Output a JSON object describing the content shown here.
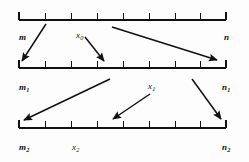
{
  "figure": {
    "background": "#fdfdfd",
    "ink": "#111111",
    "width": 249,
    "height": 162,
    "rows": [
      {
        "id": "row-0",
        "y": 20,
        "x_start": 19,
        "x_end": 226,
        "ticks": [
          19,
          45,
          71,
          97,
          123,
          149,
          175,
          200,
          226
        ],
        "end_caps": [
          "left",
          "right"
        ],
        "labels": [
          {
            "name": "m",
            "text": "m",
            "sub": "",
            "x": 19,
            "y": 33,
            "style": "bold-italic"
          },
          {
            "name": "x0",
            "text": "x",
            "sub": "0",
            "x": 76,
            "y": 31,
            "style": "plain-italic"
          },
          {
            "name": "n",
            "text": "n",
            "sub": "",
            "x": 224,
            "y": 33,
            "style": "bold-italic"
          }
        ]
      },
      {
        "id": "row-1",
        "y": 68,
        "x_start": 19,
        "x_end": 226,
        "ticks": [
          19,
          45,
          71,
          97,
          123,
          149,
          175,
          200,
          226
        ],
        "end_caps": [
          "left",
          "right"
        ],
        "labels": [
          {
            "name": "m1",
            "text": "m",
            "sub": "1",
            "x": 19,
            "y": 83,
            "style": "bold-italic"
          },
          {
            "name": "x1",
            "text": "x",
            "sub": "1",
            "x": 148,
            "y": 82,
            "style": "plain-italic"
          },
          {
            "name": "n1",
            "text": "n",
            "sub": "1",
            "x": 222,
            "y": 83,
            "style": "bold-italic"
          }
        ]
      },
      {
        "id": "row-2",
        "y": 128,
        "x_start": 19,
        "x_end": 226,
        "ticks": [
          19,
          45,
          71,
          97,
          123,
          149,
          175,
          200,
          226
        ],
        "end_caps": [
          "left",
          "right"
        ],
        "labels": [
          {
            "name": "m2",
            "text": "m",
            "sub": "2",
            "x": 19,
            "y": 143,
            "style": "bold-italic"
          },
          {
            "name": "x2",
            "text": "x",
            "sub": "2",
            "x": 72,
            "y": 143,
            "style": "plain-italic"
          },
          {
            "name": "n2",
            "text": "n",
            "sub": "2",
            "x": 222,
            "y": 143,
            "style": "bold-italic"
          }
        ]
      }
    ],
    "arrows": [
      {
        "name": "arrow-m-to-m1",
        "x1": 46,
        "y1": 24,
        "x2": 22,
        "y2": 61
      },
      {
        "name": "arrow-x0-to-mid",
        "x1": 85,
        "y1": 37,
        "x2": 104,
        "y2": 61
      },
      {
        "name": "arrow-x0-to-n1",
        "x1": 112,
        "y1": 27,
        "x2": 217,
        "y2": 60
      },
      {
        "name": "arrow-mid-to-m2",
        "x1": 110,
        "y1": 79,
        "x2": 24,
        "y2": 120
      },
      {
        "name": "arrow-x1-to-x2",
        "x1": 150,
        "y1": 94,
        "x2": 113,
        "y2": 119
      },
      {
        "name": "arrow-n1-to-n2",
        "x1": 192,
        "y1": 79,
        "x2": 221,
        "y2": 119
      }
    ]
  }
}
